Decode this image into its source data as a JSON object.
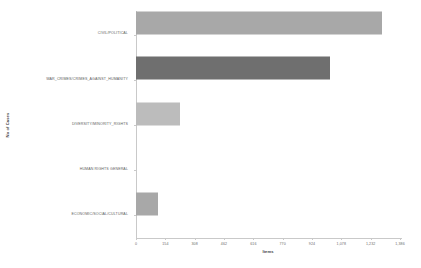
{
  "chart_data": {
    "type": "bar",
    "orientation": "horizontal",
    "title": "",
    "xlabel": "Items",
    "ylabel": "No of Cases",
    "grid": false,
    "legend": "none",
    "xlim": [
      0,
      1386
    ],
    "xticks": [
      "0",
      "154",
      "308",
      "462",
      "616",
      "770",
      "924",
      "1,078",
      "1,232",
      "1,386"
    ],
    "xtick_values": [
      0,
      154,
      308,
      462,
      616,
      770,
      924,
      1078,
      1232,
      1386
    ],
    "categories": [
      "CIVIL/POLITICAL",
      "WAR_CRIMES/CRIMES_AGAINST_HUMANITY",
      "DIVERSITY/MINORITY_RIGHTS",
      "HUMAN RIGHTS GENERAL",
      "ECONOMIC/SOCIAL/CULTURAL"
    ],
    "values": [
      1290,
      1020,
      230,
      0,
      115
    ],
    "bar_colors": [
      "#a8a8a8",
      "#6f6f6f",
      "#bcbcbc",
      "#bcbcbc",
      "#a8a8a8"
    ],
    "axis_color": "#c9c9c9",
    "background": "#ffffff",
    "text_color": "#5e5e5e"
  }
}
